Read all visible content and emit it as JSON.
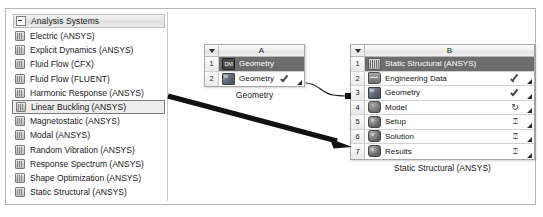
{
  "toolbox": {
    "header": {
      "label": "Analysis Systems",
      "expander_icon": "collapse-minus-icon"
    },
    "items": [
      {
        "label": "Electric (ANSYS)",
        "icon": "analysis-system-icon",
        "selected": false
      },
      {
        "label": "Explicit Dynamics (ANSYS)",
        "icon": "analysis-system-icon",
        "selected": false
      },
      {
        "label": "Fluid Flow (CFX)",
        "icon": "analysis-system-icon",
        "selected": false
      },
      {
        "label": "Fluid Flow (FLUENT)",
        "icon": "analysis-system-icon",
        "selected": false
      },
      {
        "label": "Harmonic Response (ANSYS)",
        "icon": "analysis-system-icon",
        "selected": false
      },
      {
        "label": "Linear Buckling (ANSYS)",
        "icon": "analysis-system-icon",
        "selected": true
      },
      {
        "label": "Magnetostatic (ANSYS)",
        "icon": "analysis-system-icon",
        "selected": false
      },
      {
        "label": "Modal (ANSYS)",
        "icon": "analysis-system-icon",
        "selected": false
      },
      {
        "label": "Random Vibration (ANSYS)",
        "icon": "analysis-system-icon",
        "selected": false
      },
      {
        "label": "Response Spectrum (ANSYS)",
        "icon": "analysis-system-icon",
        "selected": false
      },
      {
        "label": "Shape Optimization (ANSYS)",
        "icon": "analysis-system-icon",
        "selected": false
      },
      {
        "label": "Static Structural (ANSYS)",
        "icon": "analysis-system-icon",
        "selected": false
      }
    ]
  },
  "workspace": {
    "system_a": {
      "column_letter": "A",
      "caption": "Geometry",
      "header_menu_icon": "chevron-down-icon",
      "rows": [
        {
          "num": "1",
          "label": "Geometry",
          "icon": "designmodeler-icon",
          "status": "none",
          "expander": false,
          "is_title": true
        },
        {
          "num": "2",
          "label": "Geometry",
          "icon": "geometry-cube-icon",
          "status": "check",
          "expander": true,
          "is_title": false
        }
      ]
    },
    "system_b": {
      "column_letter": "B",
      "caption": "Static Structural (ANSYS)",
      "header_menu_icon": "chevron-down-icon",
      "rows": [
        {
          "num": "1",
          "label": "Static Structural (ANSYS)",
          "icon": "analysis-system-icon",
          "status": "none",
          "expander": false,
          "is_title": true
        },
        {
          "num": "2",
          "label": "Engineering Data",
          "icon": "engineering-data-icon",
          "status": "check",
          "expander": true,
          "is_title": false
        },
        {
          "num": "3",
          "label": "Geometry",
          "icon": "geometry-cube-icon",
          "status": "check",
          "expander": true,
          "is_title": false
        },
        {
          "num": "4",
          "label": "Model",
          "icon": "model-icon",
          "status": "refresh",
          "expander": true,
          "is_title": false
        },
        {
          "num": "5",
          "label": "Setup",
          "icon": "setup-icon",
          "status": "bolt",
          "expander": true,
          "is_title": false
        },
        {
          "num": "6",
          "label": "Solution",
          "icon": "solution-icon",
          "status": "bolt",
          "expander": true,
          "is_title": false
        },
        {
          "num": "7",
          "label": "Results",
          "icon": "results-icon",
          "status": "bolt",
          "expander": true,
          "is_title": false
        }
      ]
    },
    "link": {
      "name": "geometry-transfer-link",
      "from": "A2",
      "to": "B3",
      "terminal_icon": "link-terminal-square"
    },
    "annotations": [
      {
        "name": "drag-annotation-arrow",
        "description": "black arrow from Linear Buckling (ANSYS) toolbox item to Solution cell B6"
      }
    ]
  },
  "colors": {
    "title_row_bg": "#6d6d6d",
    "title_row_text": "#ffffff",
    "panel_border": "#a8a8a8",
    "selection_border": "#7a7a7a",
    "annotation_arrow": "#111111"
  }
}
